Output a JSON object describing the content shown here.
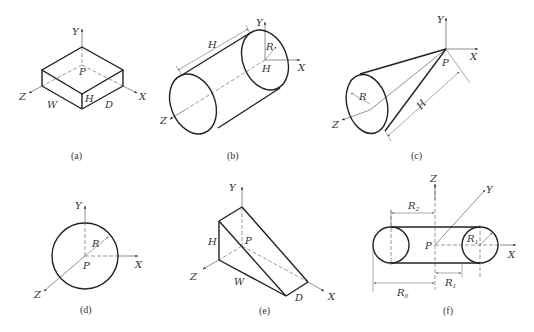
{
  "figures": {
    "a": {
      "caption": "(a)",
      "shape": "box",
      "labels": {
        "y": "Y",
        "x": "X",
        "z": "Z",
        "p": "P",
        "h": "H",
        "w": "W",
        "d": "D"
      }
    },
    "b": {
      "caption": "(b)",
      "shape": "cylinder",
      "labels": {
        "y": "Y",
        "x": "X",
        "z": "Z",
        "h_top": "H",
        "r": "R",
        "h_center": "H"
      }
    },
    "c": {
      "caption": "(c)",
      "shape": "cone",
      "labels": {
        "y": "Y",
        "x": "X",
        "z": "Z",
        "p": "P",
        "r": "R",
        "h": "H"
      }
    },
    "d": {
      "caption": "(d)",
      "shape": "sphere",
      "labels": {
        "y": "Y",
        "x": "X",
        "z": "Z",
        "p": "P",
        "r": "R"
      }
    },
    "e": {
      "caption": "(e)",
      "shape": "wedge",
      "labels": {
        "y": "Y",
        "x": "X",
        "z": "Z",
        "p": "P",
        "h": "H",
        "w": "W",
        "d": "D"
      }
    },
    "f": {
      "caption": "(f)",
      "shape": "torus",
      "labels": {
        "y": "Y",
        "x": "X",
        "z": "Z",
        "p": "P",
        "r2": "R",
        "r2_sub": "2",
        "r1_inner": "R",
        "r1_inner_sub": "1",
        "r1": "R",
        "r1_sub": "1",
        "r0": "R",
        "r0_sub": "0"
      }
    }
  }
}
